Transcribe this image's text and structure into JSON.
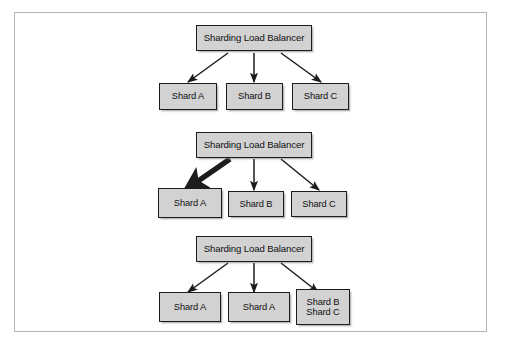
{
  "figure": {
    "background_color": "#ffffff",
    "frame_color": "#b4b4b4",
    "node_fill": "#d2d2d2",
    "node_border": "#1c1c1c",
    "arrow_color": "#1c1c1c",
    "type": "diagram"
  },
  "sections": [
    {
      "name": "top",
      "balancer": {
        "label": "Sharding Load Balancer"
      },
      "shards": [
        {
          "label": "Shard A"
        },
        {
          "label": "Shard B"
        },
        {
          "label": "Shard C"
        }
      ]
    },
    {
      "name": "middle",
      "balancer": {
        "label": "Sharding Load Balancer"
      },
      "shards": [
        {
          "label": "Shard A"
        },
        {
          "label": "Shard B"
        },
        {
          "label": "Shard C"
        }
      ]
    },
    {
      "name": "bottom",
      "balancer": {
        "label": "Sharding Load Balancer"
      },
      "shards": [
        {
          "label": "Shard A"
        },
        {
          "label": "Shard A"
        },
        {
          "label": "Shard B\nShard C"
        }
      ]
    }
  ]
}
